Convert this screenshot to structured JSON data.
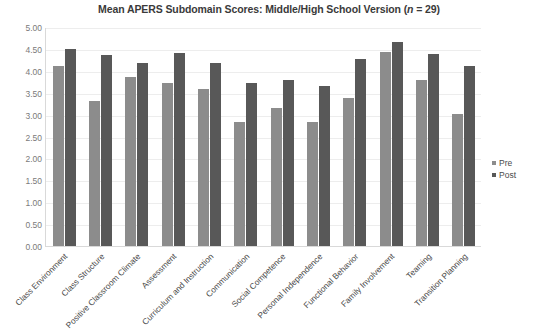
{
  "chart_data": {
    "type": "bar",
    "title": "Mean APERS Subdomain Scores: Middle/High School Version (n = 29)",
    "title_plain": "Mean APERS Subdomain Scores: Middle/High School Version (",
    "title_italic": "n",
    "title_tail": " = 29)",
    "xlabel": "",
    "ylabel": "",
    "ylim": [
      0,
      5
    ],
    "ytick_step": 0.5,
    "grid": true,
    "legend_position": "right",
    "categories": [
      "Class Environment",
      "Class Structure",
      "Positive Classroom Climate",
      "Assessment",
      "Curriculum and Instruction",
      "Communication",
      "Social Competence",
      "Personal Independence",
      "Functional Behavior",
      "Family Involvement",
      "Teaming",
      "Transition Planning"
    ],
    "ytick_labels": [
      "5.00",
      "4.50",
      "4.00",
      "3.50",
      "3.00",
      "2.50",
      "2.00",
      "1.50",
      "1.00",
      "0.50",
      "0.00"
    ],
    "ytick_values": [
      5.0,
      4.5,
      4.0,
      3.5,
      3.0,
      2.5,
      2.0,
      1.5,
      1.0,
      0.5,
      0.0
    ],
    "series": [
      {
        "name": "Pre",
        "color": "#8c8c8c",
        "values": [
          4.1,
          3.32,
          3.85,
          3.72,
          3.58,
          2.82,
          3.15,
          2.82,
          3.38,
          4.42,
          3.8,
          3.02
        ]
      },
      {
        "name": "Post",
        "color": "#585858",
        "values": [
          4.5,
          4.35,
          4.18,
          4.4,
          4.18,
          3.72,
          3.8,
          3.65,
          4.28,
          4.65,
          4.38,
          4.12
        ]
      }
    ]
  },
  "legend": {
    "items": [
      {
        "label": "Pre",
        "color": "#8c8c8c"
      },
      {
        "label": "Post",
        "color": "#585858"
      }
    ]
  }
}
